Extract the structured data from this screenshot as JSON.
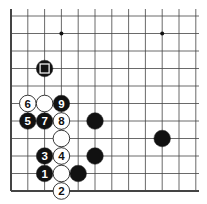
{
  "diagram": {
    "type": "go-board-fragment",
    "grid": {
      "cols": 12,
      "rows": 11,
      "x0": 11,
      "y0": 16,
      "dx": 16.8,
      "dy": 17.5,
      "left_edge": true,
      "bottom_edge": true,
      "line_color": "#444444"
    },
    "star_points": [
      {
        "col": 3,
        "row": 1
      },
      {
        "col": 9,
        "row": 1
      }
    ],
    "stones": [
      {
        "col": 2,
        "row": 3,
        "color": "black",
        "label": "",
        "marker": "square"
      },
      {
        "col": 1,
        "row": 5,
        "color": "white",
        "label": "6"
      },
      {
        "col": 2,
        "row": 5,
        "color": "white",
        "label": ""
      },
      {
        "col": 3,
        "row": 5,
        "color": "black",
        "label": "9"
      },
      {
        "col": 1,
        "row": 6,
        "color": "black",
        "label": "5"
      },
      {
        "col": 2,
        "row": 6,
        "color": "black",
        "label": "7"
      },
      {
        "col": 3,
        "row": 6,
        "color": "white",
        "label": "8"
      },
      {
        "col": 5,
        "row": 6,
        "color": "black",
        "label": ""
      },
      {
        "col": 3,
        "row": 7,
        "color": "white",
        "label": ""
      },
      {
        "col": 9,
        "row": 7,
        "color": "black",
        "label": ""
      },
      {
        "col": 2,
        "row": 8,
        "color": "black",
        "label": "3"
      },
      {
        "col": 3,
        "row": 8,
        "color": "white",
        "label": "4"
      },
      {
        "col": 5,
        "row": 8,
        "color": "black",
        "label": ""
      },
      {
        "col": 2,
        "row": 9,
        "color": "black",
        "label": "1"
      },
      {
        "col": 3,
        "row": 9,
        "color": "white",
        "label": ""
      },
      {
        "col": 4,
        "row": 9,
        "color": "black",
        "label": ""
      },
      {
        "col": 3,
        "row": 10,
        "color": "white",
        "label": "2"
      }
    ],
    "colors": {
      "black_stone": "#111111",
      "white_stone": "#ffffff",
      "stone_outline": "#222222",
      "background": "#ffffff"
    }
  }
}
